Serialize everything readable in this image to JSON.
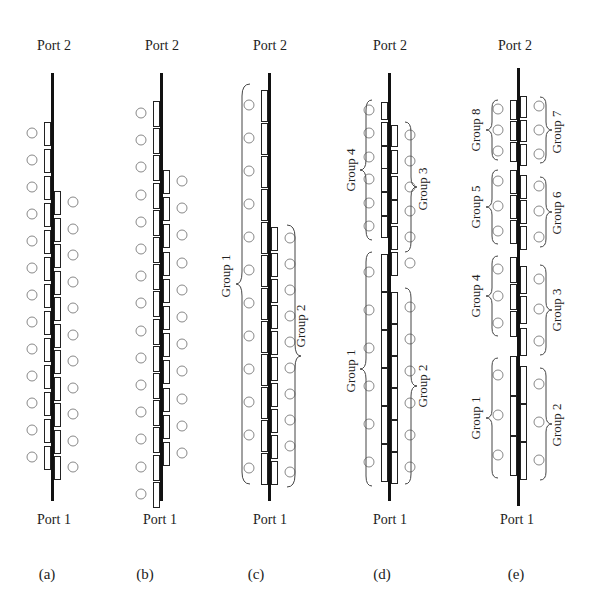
{
  "figure": {
    "top_label": "Port 2",
    "bottom_label": "Port 1",
    "panels": [
      {
        "id": "a",
        "caption": "(a)",
        "groups": []
      },
      {
        "id": "b",
        "caption": "(b)",
        "groups": []
      },
      {
        "id": "c",
        "caption": "(c)",
        "groups": [
          {
            "label": "Group 1",
            "side": "left"
          },
          {
            "label": "Group 2",
            "side": "right"
          }
        ]
      },
      {
        "id": "d",
        "caption": "(d)",
        "groups": [
          {
            "label": "Group 4",
            "side": "left"
          },
          {
            "label": "Group 3",
            "side": "right"
          },
          {
            "label": "Group 1",
            "side": "left"
          },
          {
            "label": "Group 2",
            "side": "right"
          }
        ]
      },
      {
        "id": "e",
        "caption": "(e)",
        "groups": [
          {
            "label": "Group 8",
            "side": "left"
          },
          {
            "label": "Group 7",
            "side": "right"
          },
          {
            "label": "Group 5",
            "side": "left"
          },
          {
            "label": "Group 6",
            "side": "right"
          },
          {
            "label": "Group 4",
            "side": "left"
          },
          {
            "label": "Group 3",
            "side": "right"
          },
          {
            "label": "Group 1",
            "side": "left"
          },
          {
            "label": "Group 2",
            "side": "right"
          }
        ]
      }
    ]
  },
  "panel_a": {
    "port_top": "Port 2",
    "port_bottom": "Port 1",
    "caption": "(a)"
  },
  "panel_b": {
    "port_top": "Port 2",
    "port_bottom": "Port 1",
    "caption": "(b)"
  },
  "panel_c": {
    "port_top": "Port 2",
    "port_bottom": "Port 1",
    "caption": "(c)",
    "group_left": "Group 1",
    "group_right": "Group 2"
  },
  "panel_d": {
    "port_top": "Port 2",
    "port_bottom": "Port 1",
    "caption": "(d)",
    "group_tl": "Group 4",
    "group_tr": "Group 3",
    "group_bl": "Group 1",
    "group_br": "Group 2"
  },
  "panel_e": {
    "port_top": "Port 2",
    "port_bottom": "Port 1",
    "caption": "(e)",
    "g8": "Group 8",
    "g7": "Group 7",
    "g5": "Group 5",
    "g6": "Group 6",
    "g4": "Group 4",
    "g3": "Group 3",
    "g1": "Group 1",
    "g2": "Group 2"
  }
}
